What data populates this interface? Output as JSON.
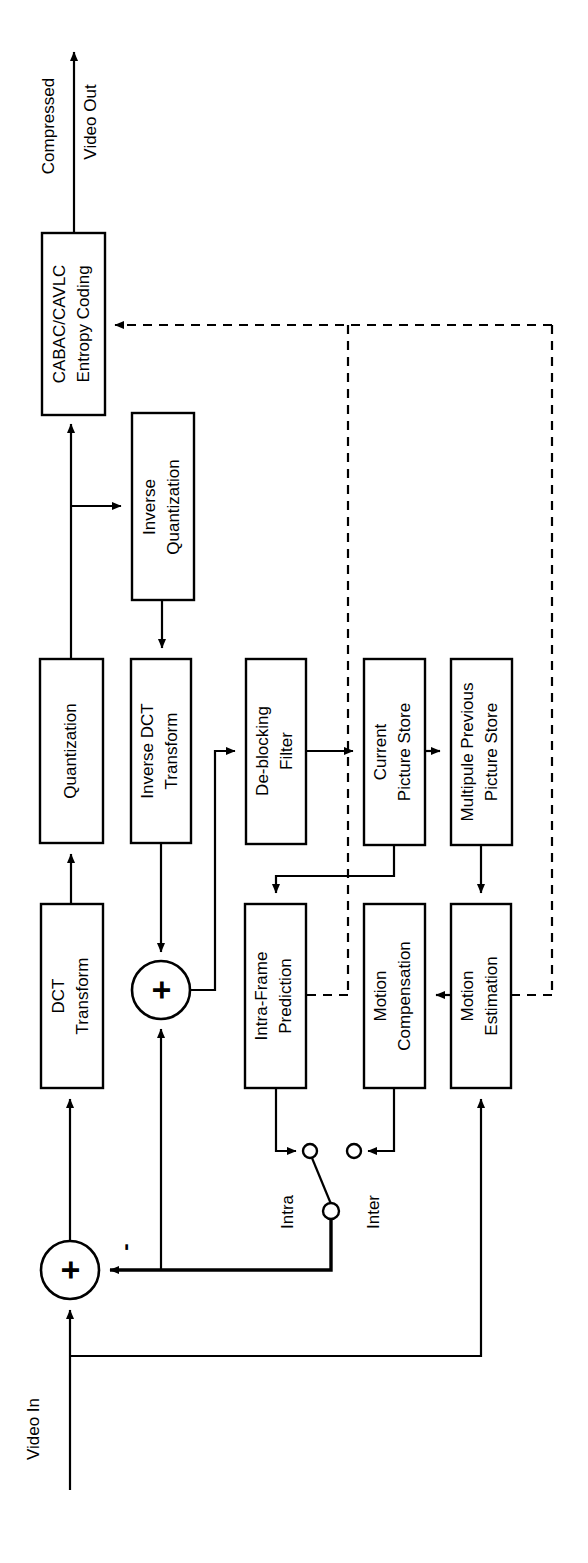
{
  "figure": {
    "kind": "block-diagram",
    "orientation_note": "rotated-90-ccw",
    "background_color": "#ffffff",
    "line_color": "#000000"
  },
  "io_labels": {
    "output_line1": "Compressed",
    "output_line2": "Video Out",
    "input": "Video In"
  },
  "blocks": [
    {
      "id": "entropy",
      "line1": "CABAC/CAVLC",
      "line2": "Entropy Coding"
    },
    {
      "id": "invquant",
      "line1": "Inverse",
      "line2": "Quantization"
    },
    {
      "id": "quant",
      "line1": "Quantization",
      "line2": ""
    },
    {
      "id": "invdct",
      "line1": "Inverse DCT",
      "line2": "Transform"
    },
    {
      "id": "deblock",
      "line1": "De-blocking",
      "line2": "Filter"
    },
    {
      "id": "curstore",
      "line1": "Current",
      "line2": "Picture Store"
    },
    {
      "id": "prevstore",
      "line1": "Multipule Previous",
      "line2": "Picture Store"
    },
    {
      "id": "dct",
      "line1": "DCT",
      "line2": "Transform"
    },
    {
      "id": "intrapred",
      "line1": "Intra-Frame",
      "line2": "Prediction"
    },
    {
      "id": "mc",
      "line1": "Motion",
      "line2": "Compensation"
    },
    {
      "id": "me",
      "line1": "Motion",
      "line2": "Estimation"
    }
  ],
  "operators": {
    "sum_plus": "+",
    "diff_plus": "+",
    "diff_minus": "-"
  },
  "switch": {
    "intra_label": "Intra",
    "inter_label": "Inter",
    "selected": "Intra"
  }
}
